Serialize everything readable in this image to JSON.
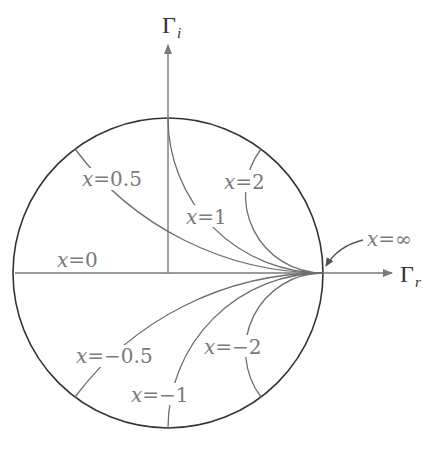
{
  "diagram": {
    "axes": {
      "imag_label": "Γ",
      "imag_sub": "i",
      "real_label": "Γ",
      "real_sub": "r"
    },
    "labels": {
      "x_0_5": {
        "var": "x",
        "eq": "=",
        "val": "0.5"
      },
      "x_1": {
        "var": "x",
        "eq": "=",
        "val": "1"
      },
      "x_2": {
        "var": "x",
        "eq": "=",
        "val": "2"
      },
      "x_0": {
        "var": "x",
        "eq": "=",
        "val": "0"
      },
      "x_inf": {
        "var": "x",
        "eq": "=",
        "val": "∞"
      },
      "x_m0_5": {
        "var": "x",
        "eq": "=",
        "val": "−0.5"
      },
      "x_m1": {
        "var": "x",
        "eq": "=",
        "val": "−1"
      },
      "x_m2": {
        "var": "x",
        "eq": "=",
        "val": "−2"
      }
    },
    "reactance_values": [
      0.5,
      1,
      2,
      0,
      -0.5,
      -1,
      -2,
      "∞"
    ],
    "colors": {
      "circle": "#333333",
      "curves": "#6e6e6e",
      "axes": "#7a7a7a",
      "labels": "#7a7a7a"
    }
  }
}
